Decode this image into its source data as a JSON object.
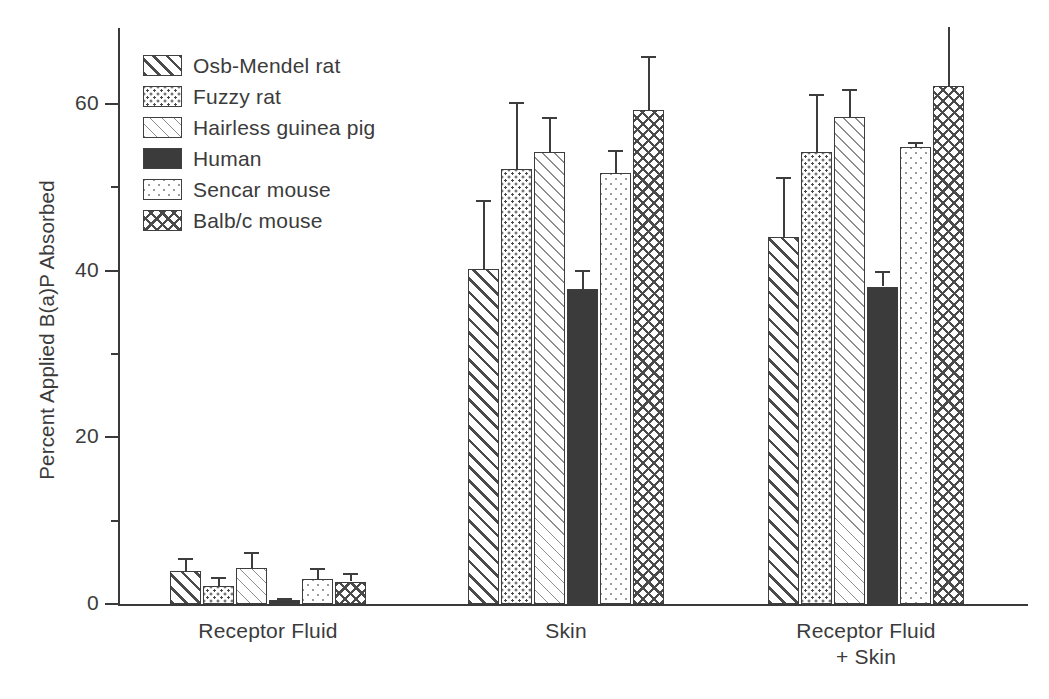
{
  "chart_data": {
    "type": "bar",
    "title": "",
    "subtitle": "",
    "xlabel": "",
    "ylabel": "Percent Applied B(a)P Absorbed",
    "ylim": [
      0,
      70
    ],
    "yticks": [
      0,
      20,
      40,
      60
    ],
    "ytick_labels": [
      "0",
      "20",
      "40",
      "60"
    ],
    "yticks_minor": [
      10,
      30,
      50,
      70
    ],
    "grid": false,
    "legend_position": "upper-left-inside",
    "categories": [
      "Receptor Fluid",
      "Skin",
      "Receptor Fluid\n+ Skin"
    ],
    "series": [
      {
        "name": "Osb-Mendel rat",
        "pattern": "diagonal-hatch-thick",
        "values": [
          4.0,
          40.2,
          44.0
        ],
        "errors": [
          1.5,
          8.3,
          7.3
        ]
      },
      {
        "name": "Fuzzy rat",
        "pattern": "dense-dots",
        "values": [
          2.2,
          52.2,
          54.3
        ],
        "errors": [
          1.1,
          8.0,
          6.9
        ]
      },
      {
        "name": "Hairless guinea pig",
        "pattern": "diagonal-hatch-thin",
        "values": [
          4.3,
          54.3,
          58.4
        ],
        "errors": [
          2.0,
          4.2,
          3.4
        ]
      },
      {
        "name": "Human",
        "pattern": "solid-dark",
        "values": [
          0.5,
          37.8,
          38.1
        ],
        "errors": [
          0.2,
          2.3,
          1.9
        ]
      },
      {
        "name": "Sencar mouse",
        "pattern": "sparse-dots",
        "values": [
          3.0,
          51.7,
          54.8
        ],
        "errors": [
          1.3,
          2.8,
          0.6
        ]
      },
      {
        "name": "Balb/c mouse",
        "pattern": "crosshatch",
        "values": [
          2.7,
          59.3,
          62.2
        ],
        "errors": [
          1.0,
          6.5,
          7.0
        ]
      }
    ]
  },
  "axis": {
    "y_title": "Percent Applied B(a)P Absorbed",
    "y_tick_labels": [
      "0",
      "20",
      "40",
      "60"
    ]
  },
  "legend": {
    "items": [
      {
        "label": "Osb-Mendel rat"
      },
      {
        "label": "Fuzzy rat"
      },
      {
        "label": "Hairless guinea pig"
      },
      {
        "label": "Human"
      },
      {
        "label": "Sencar mouse"
      },
      {
        "label": "Balb/c mouse"
      }
    ]
  },
  "groups": [
    {
      "label_line1": "Receptor Fluid",
      "label_line2": ""
    },
    {
      "label_line1": "Skin",
      "label_line2": ""
    },
    {
      "label_line1": "Receptor Fluid",
      "label_line2": "+ Skin"
    }
  ],
  "colors": {
    "ink": "#3b3b3b",
    "pattern_ink": "#4a4a4a",
    "pattern_light": "#9a9a9a",
    "background": "#ffffff"
  }
}
